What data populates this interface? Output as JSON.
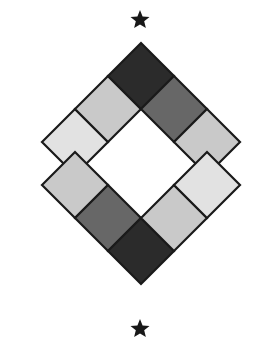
{
  "canvas": {
    "width": 260,
    "height": 355,
    "background": "#ffffff",
    "title": "Checkered Diamond Medallion"
  },
  "palette": {
    "dark": "#2b2b2b",
    "medium_gray": "#676767",
    "light_gray": "#c9c9c9",
    "pale_gray": "#e2e2e2",
    "outline": "#1a1a1a",
    "white": "#ffffff",
    "star": "#181818"
  },
  "figure": {
    "shape": "diamond-outline-checkerboard",
    "center": {
      "x": 141,
      "y": 180
    },
    "top_apex": {
      "x": 141,
      "y": 38
    },
    "bottom_apex": {
      "x": 141,
      "y": 318
    },
    "left_vertex": {
      "x": 42,
      "y": 142
    },
    "right_vertex": {
      "x": 240,
      "y": 142
    },
    "band_thickness": 46,
    "hollow_center": true
  },
  "bands": [
    {
      "name": "top-chevron",
      "position": "upper",
      "tiles": [
        {
          "index": 0,
          "side": "left",
          "order": "outer",
          "fill": "#e2e2e2",
          "tone": "pale_gray"
        },
        {
          "index": 1,
          "side": "left",
          "order": "inner",
          "fill": "#c9c9c9",
          "tone": "light_gray"
        },
        {
          "index": 2,
          "side": "apex",
          "order": "center",
          "fill": "#2b2b2b",
          "tone": "dark"
        },
        {
          "index": 3,
          "side": "right",
          "order": "inner",
          "fill": "#676767",
          "tone": "medium_gray"
        },
        {
          "index": 4,
          "side": "right",
          "order": "outer",
          "fill": "#c9c9c9",
          "tone": "light_gray"
        }
      ]
    },
    {
      "name": "bottom-chevron",
      "position": "lower",
      "tiles": [
        {
          "index": 0,
          "side": "left",
          "order": "outer",
          "fill": "#c9c9c9",
          "tone": "light_gray"
        },
        {
          "index": 1,
          "side": "left",
          "order": "inner",
          "fill": "#676767",
          "tone": "medium_gray"
        },
        {
          "index": 2,
          "side": "apex",
          "order": "center",
          "fill": "#2b2b2b",
          "tone": "dark"
        },
        {
          "index": 3,
          "side": "right",
          "order": "inner",
          "fill": "#c9c9c9",
          "tone": "light_gray"
        },
        {
          "index": 4,
          "side": "right",
          "order": "outer",
          "fill": "#e2e2e2",
          "tone": "pale_gray"
        }
      ]
    }
  ],
  "stars": [
    {
      "name": "top-star",
      "x": 140,
      "y": 20,
      "radius": 10,
      "points": 5,
      "fill": "#181818"
    },
    {
      "name": "bottom-star",
      "x": 140,
      "y": 329,
      "radius": 10,
      "points": 5,
      "fill": "#181818"
    }
  ]
}
